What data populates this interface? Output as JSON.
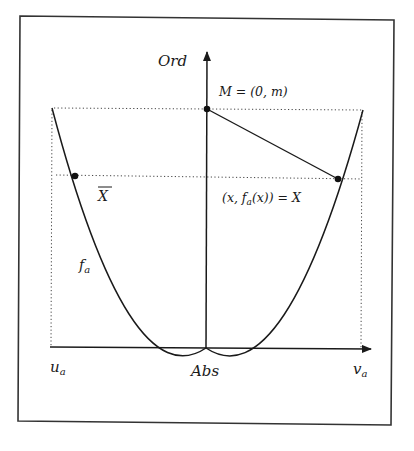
{
  "figure": {
    "axes": {
      "y_label": "Ord",
      "x_label": "Abs",
      "x_left_label": "u",
      "x_left_sub": "a",
      "x_right_label": "v",
      "x_right_sub": "a"
    },
    "curve": {
      "name": "f",
      "sub": "a",
      "type": "parabola"
    },
    "points": {
      "M": {
        "label": "M = (0, m)"
      },
      "X": {
        "label_pre": "(x, f",
        "label_sub": "a",
        "label_post": "(x)) = X"
      },
      "Xbar": {
        "label": "X"
      }
    },
    "colors": {
      "ink": "#1a1a1a",
      "frame": "#333333",
      "background": "#ffffff"
    }
  }
}
